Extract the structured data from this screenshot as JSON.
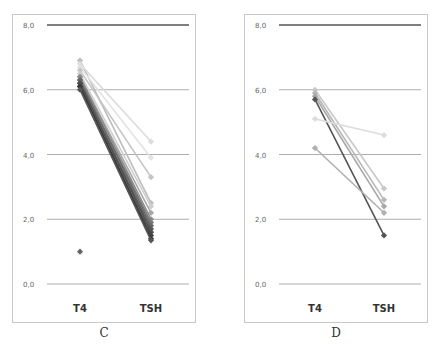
{
  "chart_data": [
    {
      "panel": "C",
      "type": "line",
      "title": "",
      "caption": "C",
      "xlabel": "",
      "ylabel": "",
      "categories": [
        "T4",
        "TSH"
      ],
      "ylim": [
        0,
        8
      ],
      "yticks": [
        "0,0",
        "2,0",
        "4,0",
        "6,0",
        "8,0"
      ],
      "grid": true,
      "legend": "none",
      "series": [
        {
          "name": "s1",
          "values": [
            6.9,
            2.5
          ],
          "color": "#bdbdbd"
        },
        {
          "name": "s2",
          "values": [
            6.8,
            4.4
          ],
          "color": "#dcdcdc"
        },
        {
          "name": "s3",
          "values": [
            6.7,
            3.9
          ],
          "color": "#e3e3e3"
        },
        {
          "name": "s4",
          "values": [
            6.6,
            3.3
          ],
          "color": "#c4c4c4"
        },
        {
          "name": "s5",
          "values": [
            6.5,
            2.4
          ],
          "color": "#cfcfcf"
        },
        {
          "name": "s6",
          "values": [
            6.4,
            2.2
          ],
          "color": "#a8a8a8"
        },
        {
          "name": "s7",
          "values": [
            6.4,
            2.0
          ],
          "color": "#8c8c8c"
        },
        {
          "name": "s8",
          "values": [
            6.3,
            1.9
          ],
          "color": "#7a7a7a"
        },
        {
          "name": "s9",
          "values": [
            6.3,
            1.8
          ],
          "color": "#6a6a6a"
        },
        {
          "name": "s10",
          "values": [
            6.2,
            1.7
          ],
          "color": "#5c5c5c"
        },
        {
          "name": "s11",
          "values": [
            6.2,
            1.6
          ],
          "color": "#4f4f4f"
        },
        {
          "name": "s12",
          "values": [
            6.1,
            1.5
          ],
          "color": "#444444"
        },
        {
          "name": "s13",
          "values": [
            6.1,
            1.4
          ],
          "color": "#3a3a3a"
        },
        {
          "name": "s14",
          "values": [
            6.0,
            1.35
          ],
          "color": "#555555"
        },
        {
          "name": "outlier",
          "values": [
            1.0,
            null
          ],
          "color": "#666666"
        }
      ]
    },
    {
      "panel": "D",
      "type": "line",
      "title": "",
      "caption": "D",
      "xlabel": "",
      "ylabel": "",
      "categories": [
        "T4",
        "TSH"
      ],
      "ylim": [
        0,
        8
      ],
      "yticks": [
        "0,0",
        "2,0",
        "4,0",
        "6,0",
        "8,0"
      ],
      "grid": true,
      "legend": "none",
      "series": [
        {
          "name": "s1",
          "values": [
            6.0,
            2.95
          ],
          "color": "#c8c8c8"
        },
        {
          "name": "s2",
          "values": [
            5.9,
            2.6
          ],
          "color": "#b8b8b8"
        },
        {
          "name": "s3",
          "values": [
            5.8,
            2.4
          ],
          "color": "#a8a8a8"
        },
        {
          "name": "s4",
          "values": [
            5.7,
            1.5
          ],
          "color": "#555555"
        },
        {
          "name": "s5",
          "values": [
            5.1,
            4.6
          ],
          "color": "#dddddd"
        },
        {
          "name": "s6",
          "values": [
            4.2,
            2.2
          ],
          "color": "#b0b0b0"
        }
      ]
    }
  ],
  "captions": {
    "c": "C",
    "d": "D"
  },
  "axis": {
    "yticks": [
      "8,0",
      "6,0",
      "4,0",
      "2,0",
      "0,0"
    ],
    "xticks": [
      "T4",
      "TSH"
    ]
  }
}
